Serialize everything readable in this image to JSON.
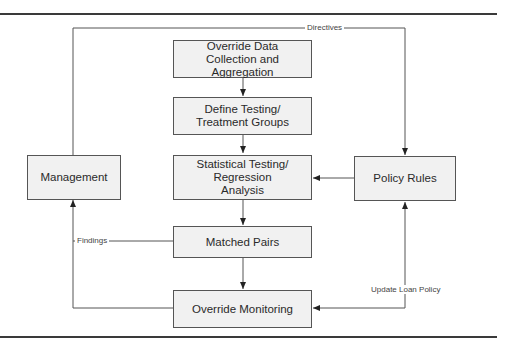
{
  "diagram": {
    "boxes": {
      "override_data": "Override Data\nCollection and\nAggregation",
      "define_groups": "Define Testing/\nTreatment Groups",
      "statistical": "Statistical Testing/\nRegression\nAnalysis",
      "matched_pairs": "Matched Pairs",
      "override_monitoring": "Override Monitoring",
      "management": "Management",
      "policy_rules": "Policy Rules"
    },
    "edge_labels": {
      "directives": "Directives",
      "findings": "Findings",
      "update_loan_policy": "Update Loan Policy"
    },
    "colors": {
      "box_fill": "#f1f1f1",
      "line": "#555555",
      "rule": "#3a3a3a"
    }
  }
}
